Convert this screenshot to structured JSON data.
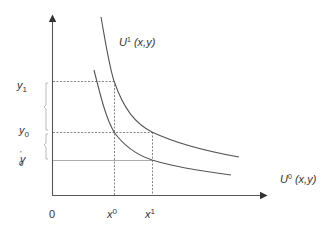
{
  "diagram": {
    "type": "indifference-curves",
    "axes": {
      "origin_label": "0",
      "x_axis_arrow": true,
      "y_axis_arrow": true
    },
    "curves": [
      {
        "id": "U1",
        "label_main": "U",
        "label_sup": "1",
        "label_args": " (x,y)",
        "position": "upper"
      },
      {
        "id": "U0",
        "label_main": "U",
        "label_sup": "0",
        "label_args": " (x,y)",
        "position": "lower"
      }
    ],
    "y_labels": {
      "y1": {
        "main": "y",
        "sub": "1"
      },
      "y0": {
        "main": "y",
        "sub": "0"
      },
      "y0_prime": {
        "main": "y",
        "sub": "0",
        "prime": "'"
      }
    },
    "x_labels": {
      "x0": {
        "main": "x",
        "sup": "0"
      },
      "x1": {
        "main": "x",
        "sup": "1"
      }
    },
    "colors": {
      "curve": "#555555",
      "axis": "#555555",
      "guide": "#666666",
      "bracket": "#999999",
      "text": "#333333"
    }
  }
}
